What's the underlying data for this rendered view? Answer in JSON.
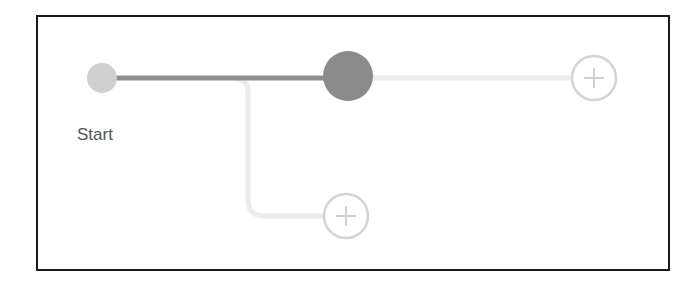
{
  "diagram": {
    "nodes": [
      {
        "id": "start",
        "label": "Start",
        "type": "start",
        "x": 102,
        "y": 78,
        "r": 15,
        "color": "#cfcfcf"
      },
      {
        "id": "step",
        "label": "",
        "type": "active-step",
        "x": 348,
        "y": 76,
        "r": 25,
        "color": "#8a8a8a"
      },
      {
        "id": "add-right",
        "label": "",
        "type": "add",
        "x": 594,
        "y": 78,
        "r": 22,
        "color": "#d4d4d4"
      },
      {
        "id": "add-branch",
        "label": "",
        "type": "add",
        "x": 346,
        "y": 216,
        "r": 22,
        "color": "#d4d4d4"
      }
    ],
    "edges": [
      {
        "from": "start",
        "to": "step",
        "color": "#8f8f8f",
        "style": "solid"
      },
      {
        "from": "step",
        "to": "add-right",
        "color": "#ececec",
        "style": "solid"
      },
      {
        "from": "start",
        "to": "add-branch",
        "color": "#ececec",
        "style": "branch"
      }
    ],
    "start_label": "Start"
  },
  "colors": {
    "frame_border": "#1a1a1a",
    "active_edge": "#8f8f8f",
    "inactive_edge": "#ececec",
    "add_circle": "#d4d4d4",
    "label_text": "#555555"
  }
}
